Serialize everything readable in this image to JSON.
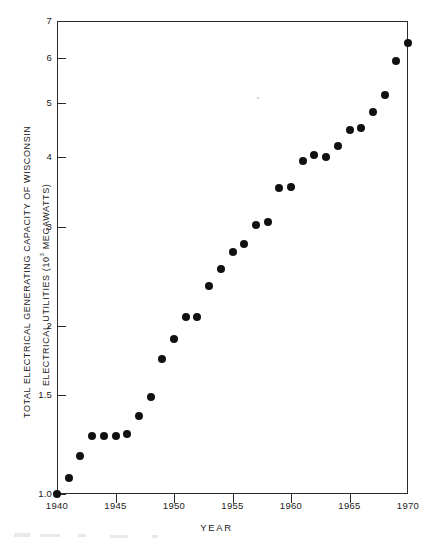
{
  "chart_data": {
    "type": "scatter",
    "title": "",
    "xlabel": "YEAR",
    "ylabel_part1": "TOTAL    ELECTRICAL    GENERATING    CAPACITY    OF    WISCONSIN",
    "ylabel_part2_pre": "ELECTRICAL   UTILITIES   (10",
    "ylabel_part2_sup": "3",
    "ylabel_part2_post": " MEGAWATTS)",
    "yscale": "log",
    "xscale": "linear",
    "xlim": [
      1940,
      1970
    ],
    "ylim": [
      1.0,
      7.0
    ],
    "grid": false,
    "legend": null,
    "xticks": [
      1940,
      1945,
      1950,
      1955,
      1960,
      1965,
      1970
    ],
    "xtick_labels": [
      "1940",
      "1945",
      "1950",
      "1955",
      "1960",
      "1965",
      "1970"
    ],
    "yticks": [
      1.0,
      1.5,
      2,
      3,
      4,
      5,
      6,
      7
    ],
    "ytick_labels": [
      "1.0",
      "1.5",
      "2",
      "3",
      "4",
      "5",
      "6",
      "7"
    ],
    "marker": "filled-circle",
    "marker_color": "#111111",
    "x": [
      1940,
      1941,
      1942,
      1943,
      1944,
      1945,
      1946,
      1947,
      1948,
      1949,
      1950,
      1951,
      1952,
      1953,
      1954,
      1955,
      1956,
      1957,
      1958,
      1959,
      1960,
      1961,
      1962,
      1963,
      1964,
      1965,
      1966,
      1967,
      1968,
      1969,
      1970
    ],
    "y": [
      1.0,
      1.07,
      1.17,
      1.27,
      1.27,
      1.27,
      1.28,
      1.38,
      1.49,
      1.74,
      1.89,
      2.07,
      2.07,
      2.35,
      2.52,
      2.71,
      2.8,
      3.02,
      3.06,
      3.52,
      3.53,
      3.93,
      4.03,
      4.0,
      4.19,
      4.47,
      4.5,
      4.81,
      5.16,
      5.95,
      6.4
    ]
  },
  "axis": {
    "y_labels": [
      "7",
      "6",
      "5",
      "4",
      "3",
      "2",
      "1.5",
      "1.0"
    ],
    "x_labels": [
      "1940",
      "1945",
      "1950",
      "1955",
      "1960",
      "1965",
      "1970"
    ]
  }
}
